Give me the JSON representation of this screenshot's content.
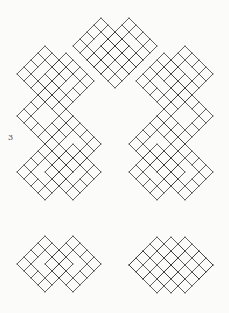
{
  "page": {
    "background": "#fbfbf9"
  },
  "figure": {
    "label": "3",
    "label_color": "#4a4a4a",
    "line_color": "#383838",
    "stroke_width": 0.8,
    "unit": 7,
    "canvas": {
      "width": 229,
      "height": 313
    },
    "shapes": [
      {
        "name": "arch",
        "modules": [
          [
            115,
            60
          ],
          [
            101,
            46
          ],
          [
            129,
            46
          ],
          [
            66,
            81
          ],
          [
            164,
            81
          ],
          [
            45,
            74
          ],
          [
            185,
            74
          ],
          [
            45,
            116
          ],
          [
            185,
            116
          ],
          [
            73,
            144
          ],
          [
            157,
            144
          ],
          [
            45,
            172
          ],
          [
            73,
            172
          ],
          [
            157,
            172
          ],
          [
            185,
            172
          ]
        ],
        "plain": []
      },
      {
        "name": "bottom-left-cluster",
        "modules": [
          [
            45,
            264
          ],
          [
            73,
            264
          ]
        ],
        "plain": []
      },
      {
        "name": "bottom-right-cluster",
        "modules": [
          [
            157,
            265
          ],
          [
            185,
            265
          ]
        ],
        "plain": [
          [
            171,
            251
          ],
          [
            171,
            279
          ],
          [
            143,
            265
          ],
          [
            199,
            265
          ]
        ]
      }
    ]
  }
}
